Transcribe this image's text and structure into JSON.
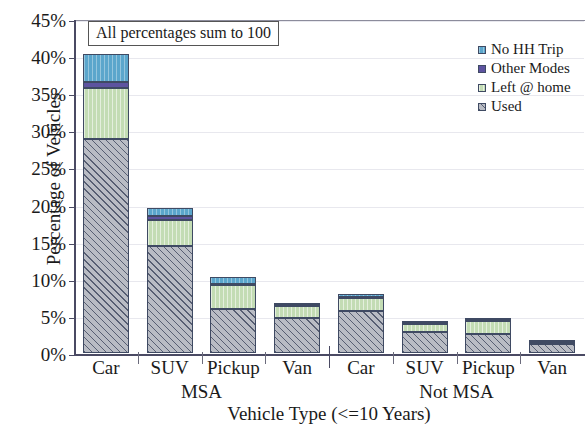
{
  "chart_data": {
    "type": "bar",
    "subtype": "stacked-bar",
    "title": "",
    "xlabel": "Vehicle Type (<=10 Years)",
    "ylabel": "Percentage of Vehicles",
    "ylim": [
      0,
      45
    ],
    "ytick_values": [
      0,
      5,
      10,
      15,
      20,
      25,
      30,
      35,
      40,
      45
    ],
    "ytick_labels": [
      "0%",
      "5%",
      "10%",
      "15%",
      "20%",
      "25%",
      "30%",
      "35%",
      "40%",
      "45%"
    ],
    "grid": true,
    "legend_position": "top-right",
    "annotation": "All percentages sum to 100",
    "categories": [
      "Car",
      "SUV",
      "Pickup",
      "Van",
      "Car",
      "SUV",
      "Pickup",
      "Van"
    ],
    "groups": [
      {
        "label": "MSA",
        "categories": [
          "Car",
          "SUV",
          "Pickup",
          "Van"
        ]
      },
      {
        "label": "Not MSA",
        "categories": [
          "Car",
          "SUV",
          "Pickup",
          "Van"
        ]
      }
    ],
    "series": [
      {
        "name": "Used",
        "color": "#b9bcc4",
        "values": [
          28.9,
          14.4,
          5.9,
          4.7,
          5.6,
          2.8,
          2.5,
          1.2
        ]
      },
      {
        "name": "Left @ home",
        "color": "#c3dcb4",
        "values": [
          6.8,
          3.5,
          3.2,
          1.6,
          1.8,
          1.1,
          1.8,
          0.2
        ]
      },
      {
        "name": "Other Modes",
        "color": "#5d53a0",
        "values": [
          0.8,
          0.5,
          0.2,
          0.2,
          0.1,
          0.1,
          0.1,
          0.05
        ]
      },
      {
        "name": "No HH Trip",
        "color": "#5ba6cc",
        "values": [
          3.8,
          1.2,
          0.9,
          0.1,
          0.5,
          0.2,
          0.3,
          0.05
        ]
      }
    ],
    "totals": [
      40.3,
      19.6,
      10.2,
      6.6,
      8.0,
      4.2,
      4.7,
      1.5
    ]
  },
  "legend": {
    "items": [
      {
        "label": "No HH Trip",
        "color": "#5ba6cc"
      },
      {
        "label": "Other Modes",
        "color": "#5d53a0"
      },
      {
        "label": "Left @ home",
        "color": "#c3dcb4"
      },
      {
        "label": "Used",
        "color": "#b9bcc4"
      }
    ]
  }
}
